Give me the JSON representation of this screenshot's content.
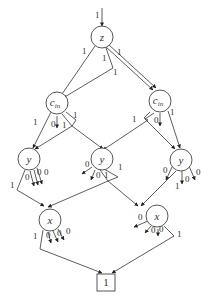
{
  "diagram": {
    "type": "decision-diagram",
    "entry_label": "1",
    "nodes": {
      "z": {
        "label": "z"
      },
      "cin_left": {
        "label": "c",
        "sub": "in"
      },
      "cin_right": {
        "label": "c",
        "sub": "in"
      },
      "y_left": {
        "label": "y"
      },
      "y_mid": {
        "label": "y"
      },
      "y_right": {
        "label": "y"
      },
      "x_left": {
        "label": "x"
      },
      "x_right": {
        "label": "x"
      },
      "terminal": {
        "label": "1"
      }
    },
    "edge_labels": {
      "z_to_cin_left_a": "1",
      "z_to_cin_left_b": "1",
      "z_to_cin_right_a": "1",
      "z_to_cin_right_b": "1",
      "cinL_to_yL": "1",
      "cinL_zero": "0",
      "cinL_to_yM_a": "1",
      "cinL_to_yM_b": "1",
      "cinR_to_yL": "1",
      "cinR_to_yR": "1",
      "cinR_zero": "0",
      "yL_out": "1",
      "yL_zero_a": "0",
      "yL_zero_b": "0",
      "yL_zero_c": "0",
      "yM_zero_a": "0",
      "yM_zero_b": "0",
      "yM_one_a": "1",
      "yM_one_b": "1",
      "yR_zero_a": "0",
      "yR_zero_b": "0",
      "yR_zero_c": "0",
      "yR_out": "1",
      "xL_out": "1",
      "xL_zero_a": "0",
      "xL_zero_b": "0",
      "xL_zero_c": "0",
      "xR_zero_a": "0",
      "xR_zero_b": "0",
      "xR_zero_c": "0",
      "xR_out": "1"
    }
  }
}
